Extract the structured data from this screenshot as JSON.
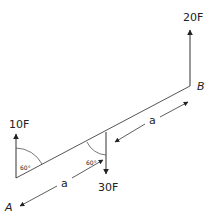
{
  "diagram": {
    "forces": [
      {
        "label": "10F",
        "direction": "up",
        "at": "A"
      },
      {
        "label": "20F",
        "direction": "up",
        "at": "B"
      },
      {
        "label": "30F",
        "direction": "down",
        "at": "midpoint"
      }
    ],
    "points": {
      "a": "A",
      "b": "B"
    },
    "dimensions": [
      {
        "label": "a",
        "segment": "A to midpoint"
      },
      {
        "label": "a",
        "segment": "midpoint to B"
      }
    ],
    "angles": [
      {
        "label": "60°",
        "at": "A"
      },
      {
        "label": "60°",
        "at": "midpoint"
      }
    ],
    "colors": {
      "stroke": "#333333",
      "text": "#222222"
    }
  }
}
